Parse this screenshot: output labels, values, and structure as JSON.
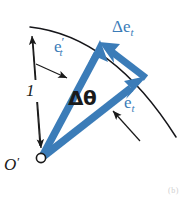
{
  "figure": {
    "background_color": "#ffffff",
    "vector_color": "#3b7cb8",
    "line_color": "#1a1a1a",
    "width": 194,
    "height": 201
  },
  "labels": {
    "et_prime": {
      "base": "e",
      "prime": "′",
      "subscript": "t",
      "color": "#3b7cb8"
    },
    "delta_et": {
      "delta": "Δe",
      "subscript": "t",
      "color": "#3b7cb8"
    },
    "et": {
      "base": "e",
      "subscript": "t",
      "color": "#3b7cb8"
    },
    "delta_theta": {
      "text": "Δθ",
      "color": "#1a1a1a"
    },
    "radius": {
      "text": "1",
      "color": "#1a1a1a"
    },
    "origin": {
      "base": "O",
      "prime": "′",
      "color": "#1a1a1a"
    }
  },
  "caption": {
    "artifact_text": "(b)"
  },
  "geometry": {
    "origin_point": {
      "x": 41,
      "y": 158
    },
    "et_prime_tip": {
      "x": 100,
      "y": 40
    },
    "et_tip": {
      "x": 147,
      "y": 76
    },
    "delta_et_tip": {
      "x": 101,
      "y": 42
    },
    "arc_start": {
      "x": 31,
      "y": 27
    },
    "arc_end": {
      "x": 176,
      "y": 136
    },
    "dimension_line_top": {
      "x": 32,
      "y": 31
    },
    "dimension_line_bottom": {
      "x": 41,
      "y": 155
    }
  }
}
